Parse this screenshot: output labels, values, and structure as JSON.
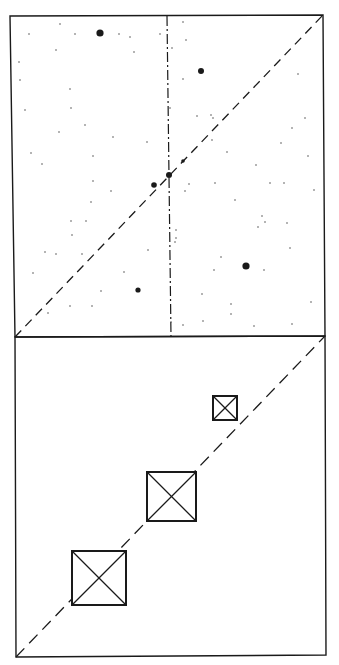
{
  "figure": {
    "width": 339,
    "height": 665,
    "background": "#ffffff",
    "ink": "#1a1a1a",
    "top_panel": {
      "frame": [
        [
          10,
          16
        ],
        [
          323,
          15
        ],
        [
          325,
          336
        ],
        [
          15,
          337
        ]
      ],
      "diagonal_dashed": {
        "from": [
          15,
          337
        ],
        "to": [
          323,
          15
        ],
        "dash": "9,6"
      },
      "vertical_dashdot": {
        "from": [
          167,
          16
        ],
        "to": [
          171,
          337
        ],
        "dash": "10,3,2,3"
      },
      "stars_large": [
        {
          "x": 100,
          "y": 33,
          "r": 3.6
        },
        {
          "x": 201,
          "y": 71,
          "r": 3.0
        },
        {
          "x": 246,
          "y": 266,
          "r": 3.6
        },
        {
          "x": 138,
          "y": 290,
          "r": 2.6
        },
        {
          "x": 154,
          "y": 185,
          "r": 2.8
        },
        {
          "x": 169,
          "y": 175,
          "r": 3.0
        },
        {
          "x": 183,
          "y": 161,
          "r": 1.8
        }
      ],
      "stars_small": [
        {
          "x": 29,
          "y": 34
        },
        {
          "x": 75,
          "y": 34
        },
        {
          "x": 56,
          "y": 50
        },
        {
          "x": 60,
          "y": 24
        },
        {
          "x": 19,
          "y": 62
        },
        {
          "x": 20,
          "y": 80
        },
        {
          "x": 70,
          "y": 89
        },
        {
          "x": 71,
          "y": 108
        },
        {
          "x": 25,
          "y": 110
        },
        {
          "x": 59,
          "y": 132
        },
        {
          "x": 85,
          "y": 125
        },
        {
          "x": 113,
          "y": 137
        },
        {
          "x": 147,
          "y": 142
        },
        {
          "x": 93,
          "y": 156
        },
        {
          "x": 31,
          "y": 153
        },
        {
          "x": 42,
          "y": 164
        },
        {
          "x": 119,
          "y": 34
        },
        {
          "x": 130,
          "y": 37
        },
        {
          "x": 134,
          "y": 52
        },
        {
          "x": 160,
          "y": 34
        },
        {
          "x": 183,
          "y": 22
        },
        {
          "x": 186,
          "y": 40
        },
        {
          "x": 183,
          "y": 79
        },
        {
          "x": 197,
          "y": 116
        },
        {
          "x": 211,
          "y": 115
        },
        {
          "x": 213,
          "y": 118
        },
        {
          "x": 298,
          "y": 74
        },
        {
          "x": 305,
          "y": 118
        },
        {
          "x": 292,
          "y": 128
        },
        {
          "x": 308,
          "y": 156
        },
        {
          "x": 172,
          "y": 48
        },
        {
          "x": 212,
          "y": 140
        },
        {
          "x": 227,
          "y": 152
        },
        {
          "x": 256,
          "y": 165
        },
        {
          "x": 270,
          "y": 183
        },
        {
          "x": 281,
          "y": 143
        },
        {
          "x": 284,
          "y": 183
        },
        {
          "x": 314,
          "y": 190
        },
        {
          "x": 91,
          "y": 202
        },
        {
          "x": 71,
          "y": 221
        },
        {
          "x": 86,
          "y": 221
        },
        {
          "x": 72,
          "y": 235
        },
        {
          "x": 82,
          "y": 254
        },
        {
          "x": 56,
          "y": 254
        },
        {
          "x": 45,
          "y": 252
        },
        {
          "x": 33,
          "y": 273
        },
        {
          "x": 124,
          "y": 272
        },
        {
          "x": 101,
          "y": 291
        },
        {
          "x": 92,
          "y": 306
        },
        {
          "x": 70,
          "y": 306
        },
        {
          "x": 48,
          "y": 313
        },
        {
          "x": 148,
          "y": 250
        },
        {
          "x": 93,
          "y": 181
        },
        {
          "x": 111,
          "y": 191
        },
        {
          "x": 176,
          "y": 230
        },
        {
          "x": 176,
          "y": 238
        },
        {
          "x": 175,
          "y": 242
        },
        {
          "x": 185,
          "y": 191
        },
        {
          "x": 189,
          "y": 184
        },
        {
          "x": 215,
          "y": 183
        },
        {
          "x": 235,
          "y": 200
        },
        {
          "x": 262,
          "y": 216
        },
        {
          "x": 287,
          "y": 223
        },
        {
          "x": 265,
          "y": 222
        },
        {
          "x": 258,
          "y": 227
        },
        {
          "x": 221,
          "y": 257
        },
        {
          "x": 214,
          "y": 270
        },
        {
          "x": 264,
          "y": 270
        },
        {
          "x": 290,
          "y": 248
        },
        {
          "x": 231,
          "y": 314
        },
        {
          "x": 254,
          "y": 326
        },
        {
          "x": 231,
          "y": 304
        },
        {
          "x": 292,
          "y": 324
        },
        {
          "x": 311,
          "y": 302
        },
        {
          "x": 202,
          "y": 294
        },
        {
          "x": 203,
          "y": 321
        },
        {
          "x": 183,
          "y": 325
        },
        {
          "x": 171,
          "y": 322
        },
        {
          "x": 170,
          "y": 108
        }
      ]
    },
    "bottom_panel": {
      "frame": [
        [
          15,
          337
        ],
        [
          325,
          336
        ],
        [
          326,
          655
        ],
        [
          16,
          657
        ]
      ],
      "diagonal_dashed": {
        "from": [
          16,
          657
        ],
        "to": [
          325,
          336
        ],
        "dash": "12,7"
      },
      "boxes": [
        {
          "label": "small-box",
          "x": 213,
          "y": 396,
          "size": 24
        },
        {
          "label": "medium-box",
          "x": 147,
          "y": 472,
          "size": 49
        },
        {
          "label": "large-box",
          "x": 72,
          "y": 551,
          "size": 54
        }
      ]
    }
  }
}
